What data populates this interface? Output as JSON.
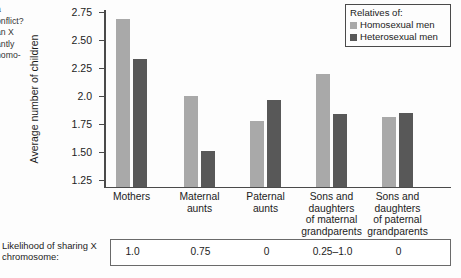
{
  "side_text": {
    "lines": [
      "a",
      "onflict?",
      "an X",
      "antly",
      "homo-"
    ]
  },
  "legend": {
    "title": "Relatives of:",
    "items": [
      {
        "label": "Homosexual men",
        "color": "#a9a9a9",
        "swatch": "light"
      },
      {
        "label": "Heterosexual men",
        "color": "#585858",
        "swatch": "dark"
      }
    ]
  },
  "table": {
    "label": "Likelihood of sharing X chromosome:",
    "values": [
      "1.0",
      "0.75",
      "0",
      "0.25–1.0",
      "0"
    ]
  },
  "chart_data": {
    "type": "bar",
    "title": "",
    "xlabel": "",
    "ylabel": "Average number of children",
    "ylim": [
      1.25,
      2.75
    ],
    "yticks": [
      1.25,
      1.5,
      1.75,
      2.0,
      2.25,
      2.5,
      2.75
    ],
    "ytick_labels": [
      "1.25",
      "1.50",
      "1.75",
      "2.0",
      "2.25",
      "2.50",
      "2.75"
    ],
    "grid": false,
    "legend_position": "top-right",
    "categories": [
      "Mothers",
      "Maternal aunts",
      "Paternal aunts",
      "Sons and daughters of maternal grandparents",
      "Sons and daughters of paternal grandparents"
    ],
    "category_labels": [
      [
        "Mothers"
      ],
      [
        "Maternal",
        "aunts"
      ],
      [
        "Paternal",
        "aunts"
      ],
      [
        "Sons and",
        "daughters",
        "of maternal",
        "grandparents"
      ],
      [
        "Sons and",
        "daughters",
        "of paternal",
        "grandparents"
      ]
    ],
    "series": [
      {
        "name": "Homosexual men",
        "color": "#a9a9a9",
        "values": [
          2.69,
          2.0,
          1.78,
          2.2,
          1.81
        ]
      },
      {
        "name": "Heterosexual men",
        "color": "#585858",
        "values": [
          2.33,
          1.51,
          1.96,
          1.84,
          1.85
        ]
      }
    ],
    "annotations": {
      "likelihood_of_sharing_x_chromosome": [
        "1.0",
        "0.75",
        "0",
        "0.25–1.0",
        "0"
      ]
    }
  }
}
